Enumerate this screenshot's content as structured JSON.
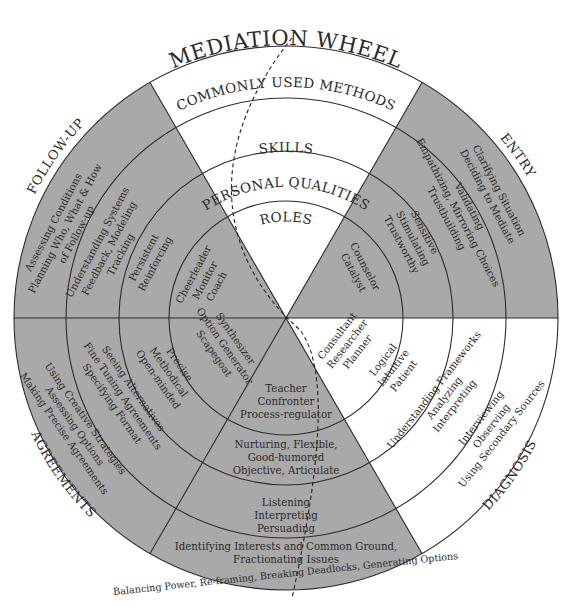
{
  "title": "MEDIATION WHEEL",
  "colors": {
    "shaded": "#a9a9a9",
    "unshaded": "#ffffff",
    "lines": "#2b2b2b",
    "text": "#2a2a2a"
  },
  "bands": {
    "outer": "COMMONLY USED METHODS",
    "second": "SKILLS",
    "third": "PERSONAL QUALITIES",
    "inner": "ROLES"
  },
  "sectors": {
    "entry": {
      "label": "ENTRY",
      "methods": [
        "Clarifying Situation",
        "Deciding to Mediate"
      ],
      "skills": [
        "Empathizing, Mirroring Choices",
        "Validating",
        "Trustbuilding"
      ],
      "qualities": [
        "Sensitive",
        "Stimulating",
        "Trustworthy"
      ],
      "roles": [
        "Counselor",
        "Catalyst"
      ]
    },
    "diagnosis": {
      "label": "DIAGNOSIS",
      "methods": [
        "Interviewing",
        "Observing",
        "Using Secondary Sources"
      ],
      "skills": [
        "Understanding Frameworks",
        "Analyzing",
        "Interpreting"
      ],
      "qualities": [
        "Logical",
        "Intuitive",
        "Patient"
      ],
      "roles": [
        "Consultant",
        "Researcher",
        "Planner"
      ]
    },
    "negotiation": {
      "methods": [
        "Identifying Interests and Common Ground,",
        "Fractionating Issues",
        "Balancing Power, Re-framing, Breaking Deadlocks, Generating Options"
      ],
      "skills": [
        "Listening",
        "Interpreting",
        "Persuading"
      ],
      "qualities": [
        "Nurturing, Flexible,",
        "Good-humored",
        "Objective, Articulate"
      ],
      "roles": [
        "Teacher",
        "Confronter",
        "Process-regulator"
      ]
    },
    "agreements": {
      "label": "AGREEMENTS",
      "methods": [
        "Using Creative Strategies",
        "Assessing Options",
        "Making Precise Agreements"
      ],
      "skills": [
        "Seeing Alternatives",
        "Fine Tuning Agreements",
        "Specifying Format"
      ],
      "qualities": [
        "Precise",
        "Methodical",
        "Open-minded"
      ],
      "roles": [
        "Synthesizer",
        "Option Generator",
        "Scapegoat"
      ]
    },
    "followup": {
      "label": "FOLLOW-UP",
      "methods": [
        "Assessing Conditions",
        "Planning Who, What & How",
        "of Follow-up"
      ],
      "skills": [
        "Understanding Systems",
        "Feedback, Modeling",
        "Tracking"
      ],
      "qualities": [
        "Persistent",
        "Reinforcing"
      ],
      "roles": [
        "Cheerleader",
        "Monitor",
        "Coach"
      ]
    }
  }
}
